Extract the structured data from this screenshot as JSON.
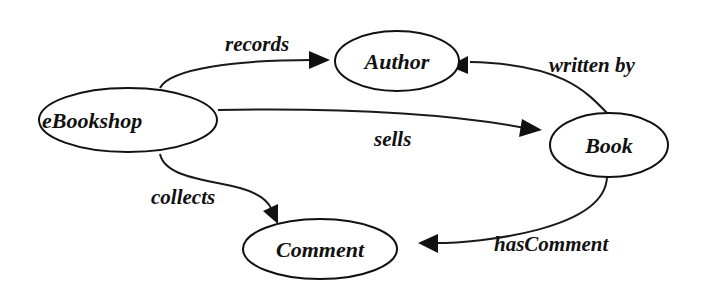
{
  "diagram": {
    "type": "concept-graph",
    "nodes": [
      {
        "id": "ebookshop",
        "label": "eBookshop"
      },
      {
        "id": "author",
        "label": "Author"
      },
      {
        "id": "book",
        "label": "Book"
      },
      {
        "id": "comment",
        "label": "Comment"
      }
    ],
    "edges": [
      {
        "from": "eBookshop",
        "to": "Author",
        "label": "records"
      },
      {
        "from": "eBookshop",
        "to": "Book",
        "label": "sells"
      },
      {
        "from": "eBookshop",
        "to": "Comment",
        "label": "collects"
      },
      {
        "from": "Book",
        "to": "Author",
        "label": "written by"
      },
      {
        "from": "Book",
        "to": "Comment",
        "label": "hasComment"
      }
    ],
    "colors": {
      "stroke": "#111111",
      "background": "#ffffff"
    }
  }
}
